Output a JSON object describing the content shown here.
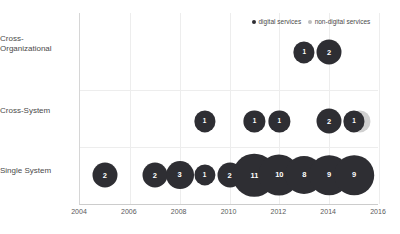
{
  "chart_data": {
    "type": "scatter",
    "title": "",
    "xlabel": "",
    "ylabel": "",
    "xlim": [
      2004,
      2016
    ],
    "xticks": [
      "2004",
      "2006",
      "2008",
      "2010",
      "2012",
      "2014",
      "2016"
    ],
    "categories": [
      "Cross-Organizational",
      "Cross-System",
      "Single System"
    ],
    "category_labels_display": [
      "Cross-\nOrganizational",
      "Cross-System",
      "Single System"
    ],
    "grid": true,
    "legend_position": "top-right",
    "legend": [
      {
        "key": "digital",
        "label": "digital services",
        "color": "#2e2e33"
      },
      {
        "key": "nondigital",
        "label": "non-digital services",
        "color": "#bfbfbf"
      }
    ],
    "series": [
      {
        "name": "digital services",
        "key": "digital",
        "points": [
          {
            "category": "Cross-Organizational",
            "year": 2013,
            "value": 1
          },
          {
            "category": "Cross-Organizational",
            "year": 2014,
            "value": 2
          },
          {
            "category": "Cross-System",
            "year": 2009,
            "value": 1
          },
          {
            "category": "Cross-System",
            "year": 2011,
            "value": 1
          },
          {
            "category": "Cross-System",
            "year": 2012,
            "value": 1
          },
          {
            "category": "Cross-System",
            "year": 2014,
            "value": 2
          },
          {
            "category": "Cross-System",
            "year": 2015,
            "value": 1
          },
          {
            "category": "Single System",
            "year": 2005,
            "value": 2
          },
          {
            "category": "Single System",
            "year": 2007,
            "value": 2
          },
          {
            "category": "Single System",
            "year": 2008,
            "value": 3
          },
          {
            "category": "Single System",
            "year": 2009,
            "value": 1
          },
          {
            "category": "Single System",
            "year": 2010,
            "value": 2
          },
          {
            "category": "Single System",
            "year": 2011,
            "value": 11
          },
          {
            "category": "Single System",
            "year": 2012,
            "value": 10
          },
          {
            "category": "Single System",
            "year": 2013,
            "value": 8
          },
          {
            "category": "Single System",
            "year": 2014,
            "value": 9
          },
          {
            "category": "Single System",
            "year": 2015,
            "value": 9
          }
        ]
      },
      {
        "name": "non-digital services",
        "key": "nondigital",
        "points": [
          {
            "category": "Cross-System",
            "year": 2015,
            "value": 1
          },
          {
            "category": "Single System",
            "year": 2010,
            "value": 1
          }
        ]
      }
    ]
  }
}
